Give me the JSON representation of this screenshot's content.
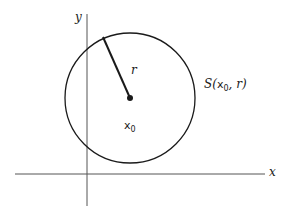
{
  "diagram": {
    "axes": {
      "x_label": "x",
      "y_label": "y"
    },
    "circle": {
      "label_prefix": "S(",
      "label_var": "x",
      "label_sub": "0",
      "label_suffix": ", r)",
      "center_label_var": "x",
      "center_label_sub": "0",
      "radius_label": "r"
    },
    "colors": {
      "stroke": "#1a1a1a",
      "axis": "#444444",
      "background": "#ffffff"
    }
  }
}
